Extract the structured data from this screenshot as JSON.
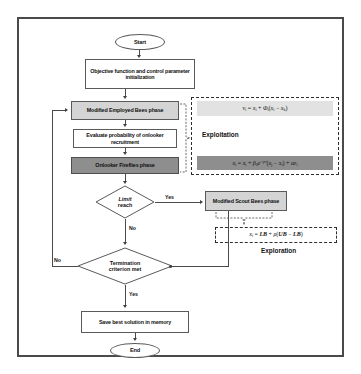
{
  "diagram": {
    "title_alt": "Flowchart of modified Artificial Bee Colony with Firefly onlooker phase",
    "nodes": {
      "start": "Start",
      "init": "Objective function and control parameter initialization",
      "employed": "Modified Employed Bees phase",
      "evaluate": "Evaluate probability of onlooker recruitment",
      "onlooker": "Onlooker Fireflies phase",
      "limit_reach_l1": "Limit",
      "limit_reach_l2": "reach",
      "scout": "Modified Scout Bees phase",
      "termination_l1": "Termination",
      "termination_l2": "criterion met",
      "save": "Save best solution in memory",
      "end": "End"
    },
    "edge_labels": {
      "limit_yes": "Yes",
      "limit_no": "No",
      "termination_no": "No",
      "termination_yes": "Yes"
    },
    "regions": {
      "exploitation_label": "Exploitation",
      "exploration_label": "Exploration"
    },
    "equations": {
      "employed_eq": "v_i = x_i + Φ_i(x_i − x_k)",
      "firefly_eq": "x_i = x_i + β_0 e^(−γr²)(x_j − x_i) + αε_i",
      "scout_eq": "x_i = LB + ρ(UB − LB)"
    },
    "colors": {
      "frame_border": "#4a4a4a",
      "node_border": "#5a5a5a",
      "shade_light": "#d4d4d4",
      "shade_dark": "#8e8e8e",
      "equation_light": "#e2e2e2",
      "equation_dark": "#8e8e8e",
      "connector": "#4a4a4a",
      "text": "#111111",
      "background": "#ffffff"
    }
  }
}
